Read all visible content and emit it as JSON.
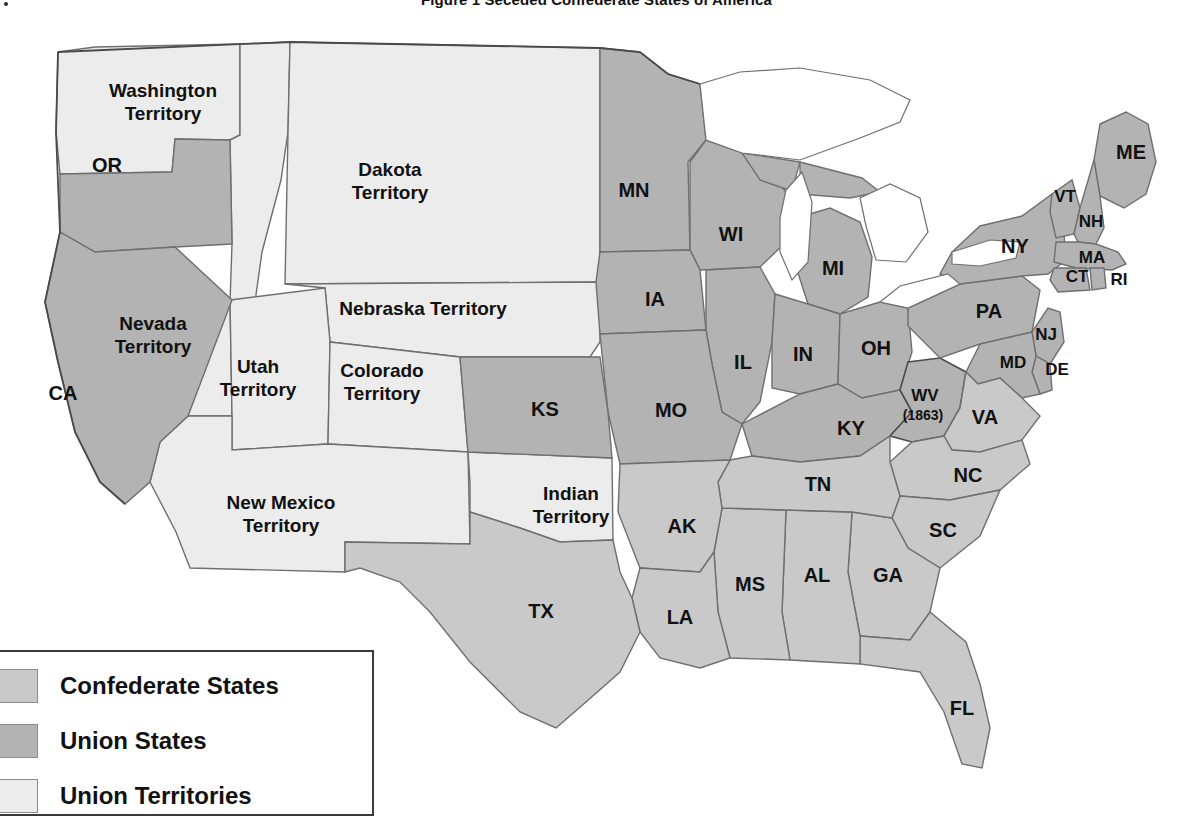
{
  "title": "Figure 1  Seceded Confederate States of America",
  "legend": {
    "items": [
      {
        "label": "Confederate States",
        "color": "#c9c9c9"
      },
      {
        "label": "Union States",
        "color": "#b3b3b3"
      },
      {
        "label": "Union Territories",
        "color": "#ececec"
      }
    ]
  },
  "colors": {
    "confederate": "#c9c9c9",
    "union": "#b3b3b3",
    "territory": "#ececec",
    "water": "#ffffff",
    "border": "#6f6f6f",
    "outline": "#4a4a4a",
    "text": "#111111",
    "background": "#ffffff"
  },
  "map": {
    "union_states": [
      {
        "abbr": "OR",
        "x": 107,
        "y": 155
      },
      {
        "abbr": "CA",
        "x": 63,
        "y": 383
      },
      {
        "abbr": "MN",
        "x": 634,
        "y": 180
      },
      {
        "abbr": "WI",
        "x": 731,
        "y": 224
      },
      {
        "abbr": "MI",
        "x": 833,
        "y": 258
      },
      {
        "abbr": "IA",
        "x": 655,
        "y": 289
      },
      {
        "abbr": "IL",
        "x": 743,
        "y": 352
      },
      {
        "abbr": "IN",
        "x": 803,
        "y": 344
      },
      {
        "abbr": "OH",
        "x": 876,
        "y": 338
      },
      {
        "abbr": "MO",
        "x": 671,
        "y": 400
      },
      {
        "abbr": "KS",
        "x": 545,
        "y": 399
      },
      {
        "abbr": "KY",
        "x": 851,
        "y": 418
      },
      {
        "abbr": "PA",
        "x": 989,
        "y": 301
      },
      {
        "abbr": "NY",
        "x": 1015,
        "y": 236
      },
      {
        "abbr": "ME",
        "x": 1131,
        "y": 142
      },
      {
        "abbr": "VT",
        "x": 1065,
        "y": 186
      },
      {
        "abbr": "NH",
        "x": 1091,
        "y": 211
      },
      {
        "abbr": "MA",
        "x": 1092,
        "y": 247
      },
      {
        "abbr": "CT",
        "x": 1077,
        "y": 266
      },
      {
        "abbr": "RI",
        "x": 1119,
        "y": 269
      },
      {
        "abbr": "NJ",
        "x": 1046,
        "y": 324
      },
      {
        "abbr": "DE",
        "x": 1057,
        "y": 359
      },
      {
        "abbr": "MD",
        "x": 1013,
        "y": 352
      },
      {
        "abbr": "WV",
        "x": 925,
        "y": 385
      }
    ],
    "wv_year": {
      "label": "(1863)",
      "x": 923,
      "y": 404
    },
    "confederate_states": [
      {
        "abbr": "VA",
        "x": 985,
        "y": 407
      },
      {
        "abbr": "NC",
        "x": 968,
        "y": 465
      },
      {
        "abbr": "SC",
        "x": 943,
        "y": 520
      },
      {
        "abbr": "GA",
        "x": 888,
        "y": 565
      },
      {
        "abbr": "FL",
        "x": 962,
        "y": 698
      },
      {
        "abbr": "AL",
        "x": 817,
        "y": 565
      },
      {
        "abbr": "MS",
        "x": 750,
        "y": 574
      },
      {
        "abbr": "TN",
        "x": 818,
        "y": 474
      },
      {
        "abbr": "AK",
        "x": 682,
        "y": 516
      },
      {
        "abbr": "LA",
        "x": 680,
        "y": 607
      },
      {
        "abbr": "TX",
        "x": 541,
        "y": 601
      }
    ],
    "territories": [
      {
        "name": "Washington Territory",
        "lines": [
          "Washington",
          "Territory"
        ],
        "x": 163,
        "y": 91
      },
      {
        "name": "Dakota Territory",
        "lines": [
          "Dakota",
          "Territory"
        ],
        "x": 390,
        "y": 170
      },
      {
        "name": "Nebraska Territory",
        "lines": [
          "Nebraska Territory"
        ],
        "x": 423,
        "y": 298
      },
      {
        "name": "Nevada Territory",
        "lines": [
          "Nevada",
          "Territory"
        ],
        "x": 153,
        "y": 324
      },
      {
        "name": "Utah Territory",
        "lines": [
          "Utah",
          "Territory"
        ],
        "x": 258,
        "y": 367
      },
      {
        "name": "Colorado Territory",
        "lines": [
          "Colorado",
          "Territory"
        ],
        "x": 382,
        "y": 371
      },
      {
        "name": "New Mexico Territory",
        "lines": [
          "New Mexico",
          "Territory"
        ],
        "x": 281,
        "y": 503
      },
      {
        "name": "Indian Territory",
        "lines": [
          "Indian",
          "Territory"
        ],
        "x": 571,
        "y": 494
      }
    ]
  }
}
